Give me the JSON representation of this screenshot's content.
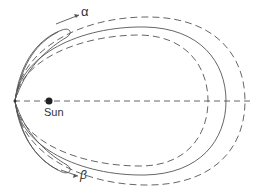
{
  "diagram": {
    "labels": {
      "sun": "Sun",
      "alpha": "α",
      "beta": "β"
    },
    "orbits": [
      {
        "name": "outer-dashed",
        "style": "dashed"
      },
      {
        "name": "middle-solid",
        "style": "solid"
      },
      {
        "name": "inner-dashed",
        "style": "dashed"
      }
    ],
    "colors": {
      "line": "#555555",
      "sun": "#222222"
    }
  }
}
